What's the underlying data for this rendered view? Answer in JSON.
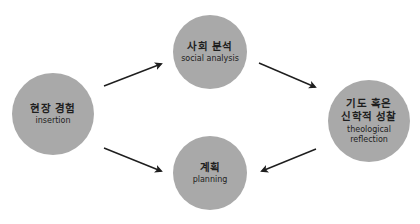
{
  "diagram": {
    "nodes": [
      {
        "id": "insertion",
        "ko": "현장 경험",
        "en": "insertion"
      },
      {
        "id": "social-analysis",
        "ko": "사회 분석",
        "en": "social analysis"
      },
      {
        "id": "theological-reflection",
        "ko_line1": "기도 혹은",
        "ko_line2": "신학적 성찰",
        "en_line1": "theological",
        "en_line2": "reflection"
      },
      {
        "id": "planning",
        "ko": "계획",
        "en": "planning"
      }
    ],
    "edges": [
      {
        "from": "insertion",
        "to": "social-analysis"
      },
      {
        "from": "social-analysis",
        "to": "theological-reflection"
      },
      {
        "from": "insertion",
        "to": "planning"
      },
      {
        "from": "theological-reflection",
        "to": "planning"
      }
    ],
    "colors": {
      "node_fill": "#a9a9a9",
      "arrow": "#1e1e1e",
      "text": "#1e1e1e"
    }
  }
}
